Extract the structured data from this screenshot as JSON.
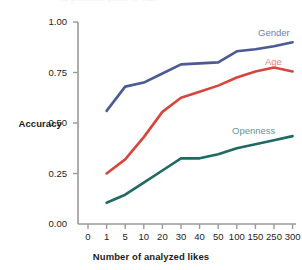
{
  "figure": {
    "clipped_header_text": "he predictive power of likes",
    "background_color": "#ffffff"
  },
  "chart_data": {
    "type": "line",
    "title": "",
    "xlabel": "Number of analyzed likes",
    "ylabel": "Accuracy",
    "x": [
      1,
      5,
      10,
      20,
      30,
      40,
      50,
      100,
      150,
      250,
      300
    ],
    "categories": [
      "1",
      "5",
      "10",
      "20",
      "30",
      "40",
      "50",
      "100",
      "150",
      "250",
      "300"
    ],
    "xtick_labels": [
      "0",
      "1",
      "5",
      "10",
      "20",
      "30",
      "40",
      "50",
      "100",
      "150",
      "250",
      "300"
    ],
    "ytick_labels": [
      "0.00",
      "0.25",
      "0.50",
      "0.75",
      "1.00"
    ],
    "ytick_values": [
      0.0,
      0.25,
      0.5,
      0.75,
      1.0
    ],
    "ylim": [
      0.0,
      1.0
    ],
    "grid": false,
    "legend_position": "inline-end-of-line",
    "axis_color": "#9a9a9a",
    "series": [
      {
        "name": "Gender",
        "color": "#4a5a96",
        "label_color": "#6f7db5",
        "values": [
          0.56,
          0.68,
          0.7,
          0.745,
          0.79,
          0.795,
          0.8,
          0.855,
          0.865,
          0.88,
          0.9
        ],
        "label_x": 258,
        "label_y": 28
      },
      {
        "name": "Age",
        "color": "#d8453c",
        "label_color": "#e8837c",
        "values": [
          0.25,
          0.32,
          0.43,
          0.555,
          0.625,
          0.655,
          0.685,
          0.725,
          0.755,
          0.775,
          0.755
        ],
        "label_x": 265,
        "label_y": 57
      },
      {
        "name": "Openness",
        "color": "#1f6a63",
        "label_color": "#5d9a92",
        "values": [
          0.105,
          0.145,
          0.205,
          0.265,
          0.325,
          0.325,
          0.345,
          0.375,
          0.395,
          0.415,
          0.435
        ],
        "label_x": 232,
        "label_y": 126
      }
    ]
  }
}
